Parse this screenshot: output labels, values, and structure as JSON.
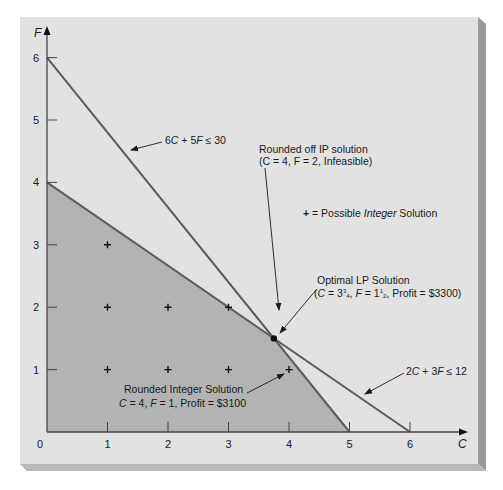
{
  "chart_data": {
    "type": "line",
    "title": "",
    "xlabel": "C",
    "ylabel": "F",
    "xlim": [
      0,
      6
    ],
    "ylim": [
      0,
      6
    ],
    "x_ticks": [
      0,
      1,
      2,
      3,
      4,
      5,
      6
    ],
    "y_ticks": [
      1,
      2,
      3,
      4,
      5,
      6
    ],
    "grid": false,
    "series": [
      {
        "name": "6C + 5F ≤ 30",
        "kind": "constraint_line",
        "points": [
          [
            0,
            6
          ],
          [
            5,
            0
          ]
        ]
      },
      {
        "name": "2C + 3F ≤ 12",
        "kind": "constraint_line",
        "points": [
          [
            0,
            4
          ],
          [
            6,
            0
          ]
        ]
      }
    ],
    "feasible_region": [
      [
        0,
        0
      ],
      [
        0,
        4
      ],
      [
        3.75,
        1.5
      ],
      [
        5,
        0
      ]
    ],
    "integer_points": [
      [
        1,
        1
      ],
      [
        2,
        1
      ],
      [
        3,
        1
      ],
      [
        4,
        1
      ],
      [
        1,
        2
      ],
      [
        2,
        2
      ],
      [
        3,
        2
      ],
      [
        1,
        3
      ]
    ],
    "optimal_lp_point": [
      3.75,
      1.5
    ],
    "annotations": [
      {
        "id": "c1",
        "text": "6C + 5F ≤ 30"
      },
      {
        "id": "c2",
        "text": "2C + 3F ≤ 12"
      },
      {
        "id": "ip",
        "lines": [
          "Rounded off IP solution",
          "(C = 4, F = 2, Infeasible)"
        ]
      },
      {
        "id": "legend",
        "text": "+ = Possible Integer Solution"
      },
      {
        "id": "lp",
        "lines": [
          "Optimal LP Solution",
          "(C = 3¾, F = 1½, Profit = $3300)"
        ]
      },
      {
        "id": "int",
        "lines": [
          "Rounded Integer Solution",
          "C = 4, F = 1, Profit = $3100"
        ]
      }
    ],
    "colors": {
      "panel": "#e2e2e2",
      "feasible": "#b3b3b3",
      "line": "#5c5c5c",
      "axis": "#444444",
      "marker": "#111111"
    }
  },
  "labels": {
    "axis_x": "C",
    "axis_y": "F",
    "x_ticks": [
      "0",
      "1",
      "2",
      "3",
      "4",
      "5",
      "6"
    ],
    "y_ticks": [
      "1",
      "2",
      "3",
      "4",
      "5",
      "6"
    ],
    "c1": {
      "a": "6",
      "b": "C",
      "c": " + 5",
      "d": "F",
      "e": " ≤ 30"
    },
    "c2": {
      "a": "2",
      "b": "C",
      "c": " + 3",
      "d": "F",
      "e": " ≤ 12"
    },
    "ip": {
      "line1": "Rounded off IP solution",
      "line2": "(C = 4, F = 2, Infeasible)"
    },
    "legend": {
      "plus": "+",
      "pre": " = Possible ",
      "it": "Integer",
      "post": " Solution"
    },
    "lp": {
      "line1": "Optimal LP Solution",
      "p1": "(",
      "C": "C",
      "v1": " = 3",
      "f1n": "3",
      "f1d": "4",
      "sep": ", ",
      "F": "F",
      "v2": " = 1",
      "f2n": "1",
      "f2d": "2",
      "tail": ", Profit = $3300)"
    },
    "int": {
      "line1": "Rounded Integer Solution",
      "C": "C",
      "v1": " = 4, ",
      "F": "F",
      "v2": " = 1, Profit = $3100"
    }
  }
}
